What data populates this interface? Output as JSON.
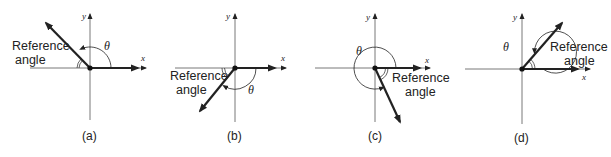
{
  "figure": {
    "panels": [
      {
        "id": "a",
        "caption": "(a)",
        "reference_label": "Reference\nangle",
        "reference_line1": "Reference",
        "reference_line2": "angle",
        "theta_label": "θ",
        "x_label": "x",
        "y_label": "y",
        "quadrant": "II",
        "terminal_direction": "upper-left"
      },
      {
        "id": "b",
        "caption": "(b)",
        "reference_line1": "Reference",
        "reference_line2": "angle",
        "theta_label": "θ",
        "x_label": "x",
        "y_label": "y",
        "quadrant": "III",
        "terminal_direction": "lower-left"
      },
      {
        "id": "c",
        "caption": "(c)",
        "reference_line1": "Reference",
        "reference_line2": "angle",
        "theta_label": "θ",
        "x_label": "x",
        "y_label": "y",
        "quadrant": "IV",
        "terminal_direction": "lower-right"
      },
      {
        "id": "d",
        "caption": "(d)",
        "reference_line1": "Reference",
        "reference_line2": "angle",
        "theta_label": "θ",
        "x_label": "x",
        "y_label": "y",
        "quadrant": "I",
        "terminal_direction": "upper-right"
      }
    ]
  }
}
